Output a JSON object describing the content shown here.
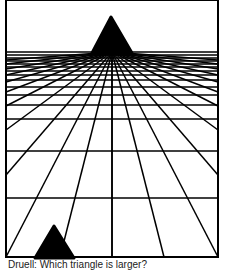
{
  "figure": {
    "type": "perspective-illusion",
    "colors": {
      "ink": "#000000",
      "background": "#ffffff"
    },
    "frame": {
      "x1": 6,
      "y1": 0,
      "x2": 218,
      "y2": 257
    },
    "vanishing_point": {
      "x": 112,
      "y": 52
    },
    "horizontal_lines_y": [
      52,
      55,
      58,
      61,
      64,
      67,
      71,
      75,
      80,
      87,
      95,
      105,
      119,
      151,
      198
    ],
    "converging_line_ends": [
      {
        "x": 6,
        "y": 257
      },
      {
        "x": 6,
        "y": 175
      },
      {
        "x": 6,
        "y": 130
      },
      {
        "x": 6,
        "y": 106
      },
      {
        "x": 6,
        "y": 92
      },
      {
        "x": 6,
        "y": 82
      },
      {
        "x": 6,
        "y": 75
      },
      {
        "x": 6,
        "y": 69
      },
      {
        "x": 6,
        "y": 64
      },
      {
        "x": 6,
        "y": 60
      },
      {
        "x": 60,
        "y": 257
      },
      {
        "x": 112,
        "y": 257
      },
      {
        "x": 164,
        "y": 257
      },
      {
        "x": 218,
        "y": 257
      },
      {
        "x": 218,
        "y": 175
      },
      {
        "x": 218,
        "y": 130
      },
      {
        "x": 218,
        "y": 106
      },
      {
        "x": 218,
        "y": 92
      },
      {
        "x": 218,
        "y": 82
      },
      {
        "x": 218,
        "y": 75
      },
      {
        "x": 218,
        "y": 69
      },
      {
        "x": 218,
        "y": 64
      },
      {
        "x": 218,
        "y": 60
      }
    ],
    "triangles": [
      {
        "name": "far-triangle",
        "apex": {
          "x": 111,
          "y": 17
        },
        "base_left": {
          "x": 92,
          "y": 53
        },
        "base_right": {
          "x": 132,
          "y": 53
        }
      },
      {
        "name": "near-triangle",
        "apex": {
          "x": 54,
          "y": 226
        },
        "base_left": {
          "x": 35,
          "y": 258
        },
        "base_right": {
          "x": 74,
          "y": 258
        }
      }
    ]
  },
  "caption": {
    "text": "Druell: Which triangle is larger?",
    "clipped": true
  }
}
